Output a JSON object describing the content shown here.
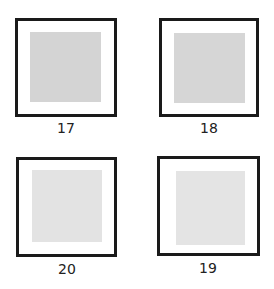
{
  "figure": {
    "panels": [
      {
        "id": "17",
        "label": "17",
        "swatch_color": "#d4d4d4"
      },
      {
        "id": "18",
        "label": "18",
        "swatch_color": "#d6d6d6"
      },
      {
        "id": "20",
        "label": "20",
        "swatch_color": "#e3e3e3"
      },
      {
        "id": "19",
        "label": "19",
        "swatch_color": "#e4e4e4"
      }
    ]
  }
}
